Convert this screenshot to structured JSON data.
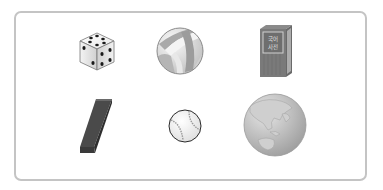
{
  "figure": {
    "layout": "2 rows x 3 columns of object illustrations inside a rounded frame",
    "items": [
      {
        "name": "dice",
        "icon": "dice-icon",
        "row": 1,
        "col": 1
      },
      {
        "name": "volleyball",
        "icon": "volleyball-icon",
        "row": 1,
        "col": 2
      },
      {
        "name": "book",
        "icon": "book-icon",
        "row": 1,
        "col": 3,
        "cover_text": [
          "국어",
          "사전"
        ]
      },
      {
        "name": "rectangular-block",
        "icon": "block-icon",
        "row": 2,
        "col": 1
      },
      {
        "name": "baseball",
        "icon": "baseball-icon",
        "row": 2,
        "col": 2
      },
      {
        "name": "globe",
        "icon": "globe-icon",
        "row": 2,
        "col": 3
      }
    ],
    "colors": {
      "frame_border": "#c4c4c4",
      "dark_gray": "#4a4a4a",
      "mid_gray": "#8c8c8c",
      "light_gray": "#d9d9d9"
    }
  }
}
